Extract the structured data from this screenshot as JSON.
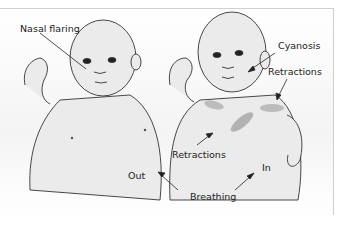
{
  "figure": {
    "labels": {
      "nasal_flaring": "Nasal flaring",
      "cyanosis": "Cyanosis",
      "retractions_upper": "Retractions",
      "retractions_lower": "Retractions",
      "out": "Out",
      "in": "In",
      "breathing": "Breathing"
    },
    "colors": {
      "skin": "#ebebeb",
      "outline": "#333333",
      "retraction_shading": "#9a9a9a",
      "border": "#cfcfcf"
    }
  }
}
